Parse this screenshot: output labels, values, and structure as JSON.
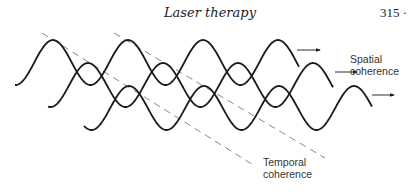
{
  "header": {
    "title": "Laser therapy",
    "page_number": "315 ·"
  },
  "labels": {
    "spatial": [
      "Spatial",
      "coherence"
    ],
    "temporal": [
      "Temporal",
      "coherence"
    ]
  },
  "colors": {
    "wave": "#1a1a1a",
    "dash": "#888888",
    "text": "#333333"
  },
  "waves": [
    {
      "x0": 15,
      "x1": 299,
      "center": 62.5,
      "amp": 22.5,
      "period": 75,
      "phase_x": 53
    },
    {
      "x0": 48,
      "x1": 333,
      "center": 85,
      "amp": 22,
      "period": 75,
      "phase_x": 88
    },
    {
      "x0": 84,
      "x1": 372,
      "center": 108,
      "amp": 22,
      "period": 75,
      "phase_x": 129
    }
  ],
  "arrows": [
    {
      "x0": 297,
      "x1": 320,
      "y": 50
    },
    {
      "x0": 335,
      "x1": 357,
      "y": 72
    },
    {
      "x0": 372,
      "x1": 394,
      "y": 95
    }
  ],
  "dashed_lines": [
    {
      "x0": 42,
      "y0": 33,
      "x1": 255,
      "y1": 166
    },
    {
      "x0": 114,
      "y0": 33,
      "x1": 325,
      "y1": 158
    }
  ]
}
